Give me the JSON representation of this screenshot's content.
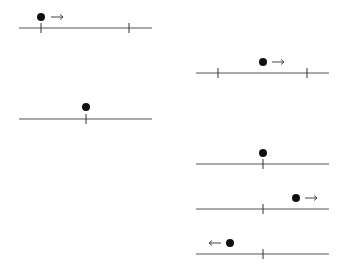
{
  "diagram": {
    "colors": {
      "line": "#555555",
      "tick": "#333333",
      "dot": "#111111",
      "arrow": "#444444"
    },
    "panels": [
      {
        "id": "p1",
        "line": {
          "x1": 19,
          "x2": 152,
          "y": 28
        },
        "ticks": [
          41,
          129
        ],
        "dot": {
          "x": 41,
          "y": 17
        },
        "arrow": {
          "dir": "right",
          "x1": 51,
          "x2": 63,
          "y": 17
        }
      },
      {
        "id": "p2",
        "line": {
          "x1": 19,
          "x2": 152,
          "y": 119
        },
        "ticks": [
          86
        ],
        "dot": {
          "x": 86,
          "y": 107
        },
        "arrow": null
      },
      {
        "id": "p3",
        "line": {
          "x1": 196,
          "x2": 329,
          "y": 73
        },
        "ticks": [
          218,
          307
        ],
        "dot": {
          "x": 263,
          "y": 62
        },
        "arrow": {
          "dir": "right",
          "x1": 272,
          "x2": 284,
          "y": 62
        }
      },
      {
        "id": "p4",
        "line": {
          "x1": 196,
          "x2": 329,
          "y": 164
        },
        "ticks": [
          263
        ],
        "dot": {
          "x": 263,
          "y": 153
        },
        "arrow": null
      },
      {
        "id": "p5",
        "line": {
          "x1": 196,
          "x2": 329,
          "y": 209
        },
        "ticks": [
          263
        ],
        "dot": {
          "x": 296,
          "y": 198
        },
        "arrow": {
          "dir": "right",
          "x1": 305,
          "x2": 317,
          "y": 198
        }
      },
      {
        "id": "p6",
        "line": {
          "x1": 196,
          "x2": 329,
          "y": 254
        },
        "ticks": [
          263
        ],
        "dot": {
          "x": 230,
          "y": 243
        },
        "arrow": {
          "dir": "left",
          "x1": 221,
          "x2": 209,
          "y": 243
        }
      }
    ]
  }
}
